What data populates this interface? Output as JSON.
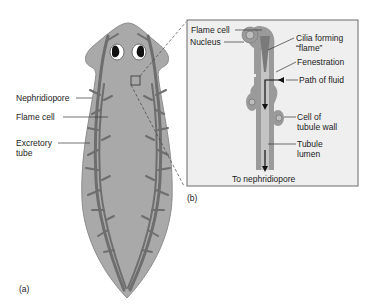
{
  "panel_a": {
    "label": "(a)",
    "labels": {
      "nephridiopore": "Nephridiopore",
      "flame_cell": "Flame cell",
      "excretory_tube_1": "Excretory",
      "excretory_tube_2": "tube"
    }
  },
  "panel_b": {
    "label": "(b)",
    "labels": {
      "flame_cell": "Flame cell",
      "nucleus": "Nucleus",
      "cilia_1": "Cilia forming",
      "cilia_2": "“flame”",
      "fenestration": "Fenestration",
      "path_of_fluid": "Path of fluid",
      "cell_wall_1": "Cell of",
      "cell_wall_2": "tubule wall",
      "tubule_1": "Tubule",
      "tubule_2": "lumen",
      "to_nephridiopore": "To nephridiopore"
    }
  },
  "colors": {
    "body": "#a9a9a9",
    "body_edge": "#8c8c8c",
    "tube": "#6e6e6e",
    "box_bg": "#efefef",
    "box_border": "#6a6a6a"
  }
}
